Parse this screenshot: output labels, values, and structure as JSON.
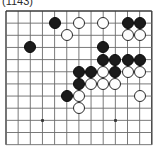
{
  "caption": "(1143)",
  "board": {
    "name": "go-board-diagram",
    "columns": 13,
    "rows": 12,
    "origin_x": 6,
    "origin_y": 11,
    "spacing": 12.15,
    "stone_radius": 6.0,
    "line_color": "#6b6b6b",
    "border_color": "#3a3a3a",
    "background_color": "#ffffff",
    "black_color": "#1b1b1b",
    "white_color": "#fdfdfd",
    "star_points": [
      {
        "col": 4,
        "row": 10
      },
      {
        "col": 10,
        "row": 10
      }
    ],
    "stones": [
      {
        "color": "black",
        "col": 5,
        "row": 2,
        "label": "black-stone-c5-r2"
      },
      {
        "color": "white",
        "col": 7,
        "row": 2,
        "label": "white-stone-c7-r2"
      },
      {
        "color": "white",
        "col": 9,
        "row": 2,
        "label": "white-stone-c9-r2"
      },
      {
        "color": "black",
        "col": 11,
        "row": 2,
        "label": "black-stone-c11-r2"
      },
      {
        "color": "black",
        "col": 12,
        "row": 2,
        "label": "black-stone-c12-r2"
      },
      {
        "color": "white",
        "col": 6,
        "row": 3,
        "label": "white-stone-c6-r3"
      },
      {
        "color": "white",
        "col": 11,
        "row": 3,
        "label": "white-stone-c11-r3"
      },
      {
        "color": "white",
        "col": 12,
        "row": 3,
        "label": "white-stone-c12-r3"
      },
      {
        "color": "black",
        "col": 3,
        "row": 4,
        "label": "black-stone-c3-r4"
      },
      {
        "color": "black",
        "col": 9,
        "row": 4,
        "label": "black-stone-c9-r4"
      },
      {
        "color": "black",
        "col": 9,
        "row": 5,
        "label": "black-stone-c9-r5"
      },
      {
        "color": "black",
        "col": 10,
        "row": 5,
        "label": "black-stone-c10-r5"
      },
      {
        "color": "black",
        "col": 11,
        "row": 5,
        "label": "black-stone-c11-r5"
      },
      {
        "color": "black",
        "col": 12,
        "row": 5,
        "label": "black-stone-c12-r5"
      },
      {
        "color": "black",
        "col": 7,
        "row": 6,
        "label": "black-stone-c7-r6"
      },
      {
        "color": "black",
        "col": 8,
        "row": 6,
        "label": "black-stone-c8-r6"
      },
      {
        "color": "white",
        "col": 9,
        "row": 6,
        "label": "white-stone-c9-r6"
      },
      {
        "color": "black",
        "col": 10,
        "row": 6,
        "label": "black-stone-c10-r6"
      },
      {
        "color": "white",
        "col": 11,
        "row": 6,
        "label": "white-stone-c11-r6"
      },
      {
        "color": "white",
        "col": 12,
        "row": 6,
        "label": "white-stone-c12-r6"
      },
      {
        "color": "black",
        "col": 7,
        "row": 7,
        "label": "black-stone-c7-r7"
      },
      {
        "color": "white",
        "col": 8,
        "row": 7,
        "label": "white-stone-c8-r7"
      },
      {
        "color": "white",
        "col": 9,
        "row": 7,
        "label": "white-stone-c9-r7"
      },
      {
        "color": "white",
        "col": 10,
        "row": 7,
        "label": "white-stone-c10-r7"
      },
      {
        "color": "black",
        "col": 6,
        "row": 8,
        "label": "black-stone-c6-r8"
      },
      {
        "color": "white",
        "col": 7,
        "row": 8,
        "label": "white-stone-c7-r8"
      },
      {
        "color": "white",
        "col": 12,
        "row": 8,
        "label": "white-stone-c12-r8"
      },
      {
        "color": "white",
        "col": 7,
        "row": 9,
        "label": "white-stone-c7-r9"
      }
    ]
  }
}
